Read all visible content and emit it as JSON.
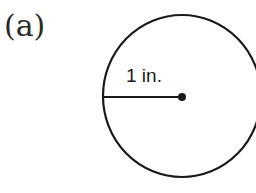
{
  "figure": {
    "part_label": "(a)",
    "radius_label": "1 in.",
    "shape": "circle",
    "colors": {
      "stroke": "#1a1a1a",
      "background": "#ffffff"
    }
  }
}
